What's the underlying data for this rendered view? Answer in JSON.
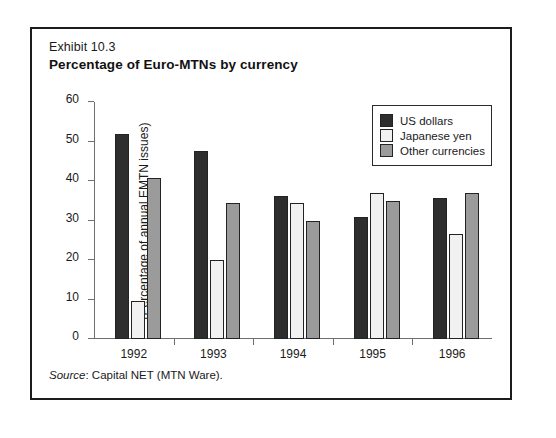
{
  "exhibit_label": "Exhibit 10.3",
  "source_note": {
    "prefix": "Source",
    "text": ": Capital NET (MTN Ware)."
  },
  "legend": {
    "items": [
      {
        "label": "US dollars",
        "color": "#2e2e2e",
        "icon": "legend-swatch-us-dollars"
      },
      {
        "label": "Japanese yen",
        "color": "#f1f1f1",
        "icon": "legend-swatch-japanese-yen"
      },
      {
        "label": "Other currencies",
        "color": "#9b9b9b",
        "icon": "legend-swatch-other-currencies"
      }
    ]
  },
  "chart_data": {
    "type": "bar",
    "title": "Percentage of Euro-MTNs by currency",
    "xlabel": "",
    "ylabel": "(Percentage of annual EMTN issues)",
    "categories": [
      "1992",
      "1993",
      "1994",
      "1995",
      "1996"
    ],
    "series": [
      {
        "name": "US dollars",
        "values": [
          52.0,
          47.5,
          36.3,
          31.0,
          35.7
        ]
      },
      {
        "name": "Japanese yen",
        "values": [
          9.5,
          20.0,
          34.5,
          37.0,
          26.7
        ]
      },
      {
        "name": "Other currencies",
        "values": [
          40.8,
          34.5,
          30.0,
          35.0,
          37.0
        ]
      }
    ],
    "ylim": [
      0,
      60
    ],
    "yticks": [
      0,
      10,
      20,
      30,
      40,
      50,
      60
    ],
    "grid": false,
    "legend_position": "top-right"
  }
}
